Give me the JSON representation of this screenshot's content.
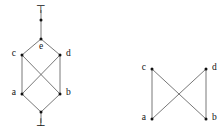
{
  "figure": {
    "title": "",
    "background_color": "#ffffff",
    "edge_color": "#555555",
    "node_color": "#111111",
    "label_color": "#111111"
  },
  "diagrams": [
    {
      "id": "left-hasse-diagram",
      "name": "bounded-lattice-diagram",
      "nodes": [
        {
          "id": "top",
          "label": "⊤",
          "kind": "glyph",
          "x": 41,
          "y": 10,
          "label_dx": 0,
          "label_dy": 0,
          "anchor": "middle"
        },
        {
          "id": "n_top",
          "label": "",
          "kind": "dot",
          "x": 41,
          "y": 20,
          "label_dx": 0,
          "label_dy": 0,
          "anchor": "middle"
        },
        {
          "id": "e",
          "label": "e",
          "kind": "dot",
          "x": 41,
          "y": 39,
          "label_dx": 0,
          "label_dy": 8,
          "anchor": "middle"
        },
        {
          "id": "c",
          "label": "c",
          "kind": "dot",
          "x": 22,
          "y": 55,
          "label_dx": -6,
          "label_dy": -1,
          "anchor": "end"
        },
        {
          "id": "d",
          "label": "d",
          "kind": "dot",
          "x": 60,
          "y": 55,
          "label_dx": 6,
          "label_dy": -1,
          "anchor": "start"
        },
        {
          "id": "a",
          "label": "a",
          "kind": "dot",
          "x": 22,
          "y": 94,
          "label_dx": -6,
          "label_dy": -1,
          "anchor": "end"
        },
        {
          "id": "b",
          "label": "b",
          "kind": "dot",
          "x": 60,
          "y": 94,
          "label_dx": 6,
          "label_dy": -1,
          "anchor": "start"
        },
        {
          "id": "n_bot",
          "label": "",
          "kind": "dot",
          "x": 41,
          "y": 112,
          "label_dx": 0,
          "label_dy": 0,
          "anchor": "middle"
        },
        {
          "id": "bottom",
          "label": "⊥",
          "kind": "glyph",
          "x": 41,
          "y": 123,
          "label_dx": 0,
          "label_dy": 0,
          "anchor": "middle"
        }
      ],
      "edges": [
        {
          "from": "top",
          "to": "n_top"
        },
        {
          "from": "n_top",
          "to": "e"
        },
        {
          "from": "e",
          "to": "c"
        },
        {
          "from": "e",
          "to": "d"
        },
        {
          "from": "c",
          "to": "a"
        },
        {
          "from": "c",
          "to": "b"
        },
        {
          "from": "d",
          "to": "a"
        },
        {
          "from": "d",
          "to": "b"
        },
        {
          "from": "a",
          "to": "n_bot"
        },
        {
          "from": "b",
          "to": "n_bot"
        },
        {
          "from": "n_bot",
          "to": "bottom"
        }
      ]
    },
    {
      "id": "right-hasse-diagram",
      "name": "unbounded-poset-diagram",
      "nodes": [
        {
          "id": "c",
          "label": "c",
          "kind": "dot",
          "x": 152,
          "y": 69,
          "label_dx": -6,
          "label_dy": -1,
          "anchor": "end"
        },
        {
          "id": "d",
          "label": "d",
          "kind": "dot",
          "x": 206,
          "y": 69,
          "label_dx": 6,
          "label_dy": -1,
          "anchor": "start"
        },
        {
          "id": "a",
          "label": "a",
          "kind": "dot",
          "x": 152,
          "y": 119,
          "label_dx": -6,
          "label_dy": -1,
          "anchor": "end"
        },
        {
          "id": "b",
          "label": "b",
          "kind": "dot",
          "x": 206,
          "y": 119,
          "label_dx": 6,
          "label_dy": -1,
          "anchor": "start"
        }
      ],
      "edges": [
        {
          "from": "c",
          "to": "a"
        },
        {
          "from": "c",
          "to": "b"
        },
        {
          "from": "d",
          "to": "a"
        },
        {
          "from": "d",
          "to": "b"
        }
      ]
    }
  ]
}
